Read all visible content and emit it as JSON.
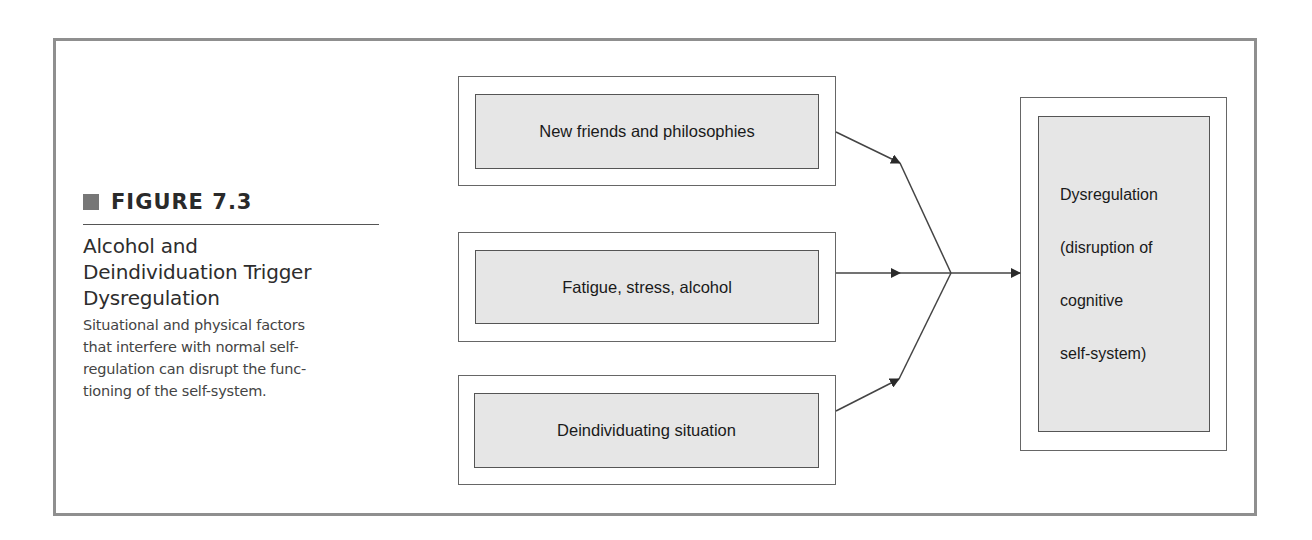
{
  "figure": {
    "label": "FIGURE 7.3",
    "title": "Alcohol and Deindividuation Trigger Dysregulation",
    "title_lines": [
      "Alcohol and",
      "Deindividuation Trigger",
      "Dysregulation"
    ],
    "description_lines": [
      "Situational and physical factors",
      "that interfere with normal self-",
      "regulation can disrupt the func-",
      "tioning of the self-system."
    ]
  },
  "diagram": {
    "inputs": [
      {
        "label": "New friends and philosophies"
      },
      {
        "label": "Fatigue, stress, alcohol"
      },
      {
        "label": "Deindividuating situation"
      }
    ],
    "output": {
      "label": "Dysregulation (disruption of cognitive self-system)",
      "lines": [
        "Dysregulation",
        "(disruption of",
        "cognitive",
        "self-system)"
      ]
    },
    "colors": {
      "frame": "#8f8f8f",
      "box_fill": "#e6e6e6",
      "line": "#444444"
    }
  }
}
